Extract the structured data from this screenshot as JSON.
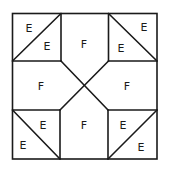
{
  "diagram": {
    "labels": {
      "tl_outer": "E",
      "tl_inner": "E",
      "tr_outer": "E",
      "tr_inner": "E",
      "bl_outer": "E",
      "bl_inner": "E",
      "br_outer": "E",
      "br_inner": "E",
      "top": "F",
      "left": "F",
      "right": "F",
      "bottom": "F"
    },
    "colors": {
      "line": "#1a1a1a",
      "background": "#ffffff"
    }
  }
}
